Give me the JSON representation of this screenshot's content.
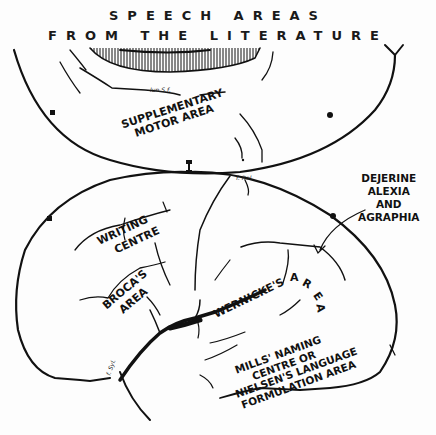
{
  "title": {
    "line1": "SPEECH AREAS",
    "line2": "FROM THE LITERATURE"
  },
  "labels": {
    "supplementary_motor": {
      "line1": "SUPPLEMENTARY",
      "line2": "MOTOR AREA"
    },
    "dejerine": {
      "line1": "DEJERINE",
      "line2": "ALEXIA",
      "line3": "AND",
      "line4": "AGRAPHIA"
    },
    "writing_centre": {
      "line1": "WRITING",
      "line2": "CENTRE"
    },
    "brocas_area": {
      "line1": "BROCA'S",
      "line2": "AREA"
    },
    "wernickes": {
      "word1": "WERNICKE'S",
      "a": "A",
      "r": "R",
      "e": "E",
      "a2": "A"
    },
    "mills": {
      "line1": "MILLS' NAMING",
      "line2": "CENTRE OR",
      "line3": "NIELSEN'S LANGUAGE",
      "line4": "FORMULATION AREA"
    },
    "small_marks": {
      "f_rol": "f. Rol.",
      "sulc": "lun.S.f.",
      "f_syl": "f. Syl."
    }
  },
  "colors": {
    "ink": "#111111",
    "paper": "#fdfdfd"
  }
}
